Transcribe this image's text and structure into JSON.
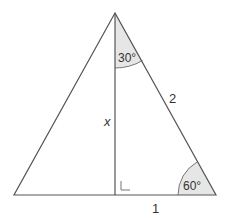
{
  "diagram": {
    "type": "triangle",
    "colors": {
      "stroke": "#555555",
      "angle_fill": "#e6e6e6",
      "text": "#333333",
      "background": "#ffffff"
    },
    "vertices": {
      "apex": [
        115,
        13
      ],
      "left": [
        14,
        195
      ],
      "right": [
        216,
        195
      ],
      "foot": [
        115,
        195
      ]
    },
    "labels": {
      "top_angle": "30°",
      "bottom_right_angle": "60°",
      "hypotenuse": "2",
      "altitude": "x",
      "base_half": "1"
    }
  }
}
